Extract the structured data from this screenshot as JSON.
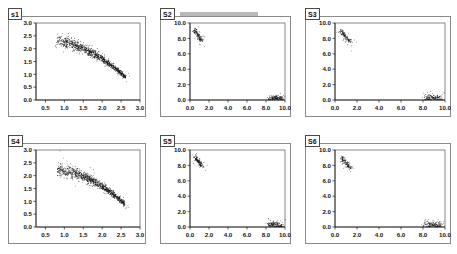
{
  "figure": {
    "layout": "2x3-grid",
    "background": "#ffffff",
    "panel_border_color": "#8a8a8a",
    "point_color": "#101010"
  },
  "panels": [
    {
      "label": "s1",
      "has_tab_bar": false,
      "chart_index": 0
    },
    {
      "label": "S2",
      "has_tab_bar": true,
      "chart_index": 1
    },
    {
      "label": "S3",
      "has_tab_bar": false,
      "chart_index": 2
    },
    {
      "label": "S4",
      "has_tab_bar": false,
      "chart_index": 3
    },
    {
      "label": "S5",
      "has_tab_bar": false,
      "chart_index": 4
    },
    {
      "label": "S6",
      "has_tab_bar": false,
      "chart_index": 5
    }
  ],
  "chart_data": [
    {
      "type": "scatter",
      "title": "s1",
      "xlabel": "",
      "ylabel": "",
      "xlim": [
        0.25,
        3.0
      ],
      "ylim": [
        0.0,
        3.0
      ],
      "xticks": [
        "0.5",
        "1.0",
        "1.5",
        "2.0",
        "2.5",
        "3.0"
      ],
      "xtickvals": [
        0.5,
        1.0,
        1.5,
        2.0,
        2.5,
        3.0
      ],
      "yticks": [
        "0.0",
        "0.5",
        "1.0",
        "1.5",
        "2.0",
        "2.5",
        "3.0"
      ],
      "ytickvals": [
        0.0,
        0.5,
        1.0,
        1.5,
        2.0,
        2.5,
        3.0
      ],
      "grid": false,
      "legend": "none",
      "cloud": {
        "shape": "descending-arc",
        "x_start": 0.82,
        "x_end": 2.62,
        "y_peak": 2.28,
        "y_end": 0.88,
        "n_points": 900,
        "spread": 0.11,
        "description": "Dense downward-curving band of points from upper-left to lower-right"
      }
    },
    {
      "type": "scatter",
      "title": "S2",
      "xlabel": "",
      "ylabel": "",
      "xlim": [
        0.0,
        10.0
      ],
      "ylim": [
        0.0,
        10.0
      ],
      "xticks": [
        "0.0",
        "2.0",
        "4.0",
        "6.0",
        "8.0",
        "10.0"
      ],
      "xtickvals": [
        0.0,
        2.0,
        4.0,
        6.0,
        8.0,
        10.0
      ],
      "yticks": [
        "0.0",
        "2.0",
        "4.0",
        "6.0",
        "8.0",
        "10.0"
      ],
      "ytickvals": [
        0.0,
        2.0,
        4.0,
        6.0,
        8.0,
        10.0
      ],
      "grid": false,
      "legend": "none",
      "clusters": [
        {
          "name": "upper-left-streak",
          "cx": 0.45,
          "cy": 9.1,
          "n_points": 110,
          "orientation": "diagonal-down-right",
          "length": 1.5,
          "width": 0.25
        },
        {
          "name": "lower-right-clump",
          "cx": 9.0,
          "cy": 0.25,
          "n_points": 120,
          "orientation": "horizontal",
          "length": 1.4,
          "width": 0.3
        }
      ]
    },
    {
      "type": "scatter",
      "title": "S3",
      "xlabel": "",
      "ylabel": "",
      "xlim": [
        0.0,
        10.0
      ],
      "ylim": [
        0.0,
        10.0
      ],
      "xticks": [
        "0.0",
        "2.0",
        "4.0",
        "6.0",
        "8.0",
        "10.0"
      ],
      "xtickvals": [
        0.0,
        2.0,
        4.0,
        6.0,
        8.0,
        10.0
      ],
      "yticks": [
        "0.0",
        "2.0",
        "4.0",
        "6.0",
        "8.0",
        "10.0"
      ],
      "ytickvals": [
        0.0,
        2.0,
        4.0,
        6.0,
        8.0,
        10.0
      ],
      "grid": false,
      "legend": "none",
      "clusters": [
        {
          "name": "upper-left-streak",
          "cx": 0.55,
          "cy": 9.0,
          "n_points": 100,
          "orientation": "diagonal-down-right",
          "length": 1.5,
          "width": 0.25
        },
        {
          "name": "lower-right-clump",
          "cx": 8.95,
          "cy": 0.3,
          "n_points": 120,
          "orientation": "horizontal",
          "length": 1.5,
          "width": 0.35
        }
      ]
    },
    {
      "type": "scatter",
      "title": "S4",
      "xlabel": "",
      "ylabel": "",
      "xlim": [
        0.25,
        3.0
      ],
      "ylim": [
        0.0,
        3.0
      ],
      "xticks": [
        "0.5",
        "1.0",
        "1.5",
        "2.0",
        "2.5",
        "3.0"
      ],
      "xtickvals": [
        0.5,
        1.0,
        1.5,
        2.0,
        2.5,
        3.0
      ],
      "yticks": [
        "0.0",
        "0.5",
        "1.0",
        "1.5",
        "2.0",
        "2.5",
        "3.0"
      ],
      "ytickvals": [
        0.0,
        0.5,
        1.0,
        1.5,
        2.0,
        2.5,
        3.0
      ],
      "grid": false,
      "legend": "none",
      "cloud": {
        "shape": "descending-arc",
        "x_start": 0.8,
        "x_end": 2.6,
        "y_peak": 2.26,
        "y_end": 0.9,
        "n_points": 900,
        "spread": 0.12,
        "description": "Dense downward-curving band of points from upper-left to lower-right"
      }
    },
    {
      "type": "scatter",
      "title": "S5",
      "xlabel": "",
      "ylabel": "",
      "xlim": [
        0.0,
        10.0
      ],
      "ylim": [
        0.0,
        10.0
      ],
      "xticks": [
        "0.0",
        "2.0",
        "4.0",
        "6.0",
        "8.0",
        "10.0"
      ],
      "xtickvals": [
        0.0,
        2.0,
        4.0,
        6.0,
        8.0,
        10.0
      ],
      "yticks": [
        "0.0",
        "2.0",
        "4.0",
        "6.0",
        "8.0",
        "10.0"
      ],
      "ytickvals": [
        0.0,
        2.0,
        4.0,
        6.0,
        8.0,
        10.0
      ],
      "grid": false,
      "legend": "none",
      "clusters": [
        {
          "name": "upper-left-streak",
          "cx": 0.5,
          "cy": 9.2,
          "n_points": 110,
          "orientation": "diagonal-down-right",
          "length": 1.4,
          "width": 0.22
        },
        {
          "name": "lower-right-clump",
          "cx": 9.0,
          "cy": 0.3,
          "n_points": 120,
          "orientation": "horizontal",
          "length": 1.5,
          "width": 0.35
        }
      ]
    },
    {
      "type": "scatter",
      "title": "S6",
      "xlabel": "",
      "ylabel": "",
      "xlim": [
        0.0,
        10.0
      ],
      "ylim": [
        0.0,
        10.0
      ],
      "xticks": [
        "0.0",
        "2.0",
        "4.0",
        "6.0",
        "8.0",
        "10.0"
      ],
      "xtickvals": [
        0.0,
        2.0,
        4.0,
        6.0,
        8.0,
        10.0
      ],
      "yticks": [
        "0.0",
        "2.0",
        "4.0",
        "6.0",
        "8.0",
        "10.0"
      ],
      "ytickvals": [
        0.0,
        2.0,
        4.0,
        6.0,
        8.0,
        10.0
      ],
      "grid": false,
      "legend": "none",
      "clusters": [
        {
          "name": "upper-left-streak",
          "cx": 0.6,
          "cy": 9.0,
          "n_points": 100,
          "orientation": "diagonal-down-right",
          "length": 1.4,
          "width": 0.22
        },
        {
          "name": "lower-right-clump",
          "cx": 8.9,
          "cy": 0.3,
          "n_points": 120,
          "orientation": "horizontal",
          "length": 1.6,
          "width": 0.35
        }
      ]
    }
  ]
}
